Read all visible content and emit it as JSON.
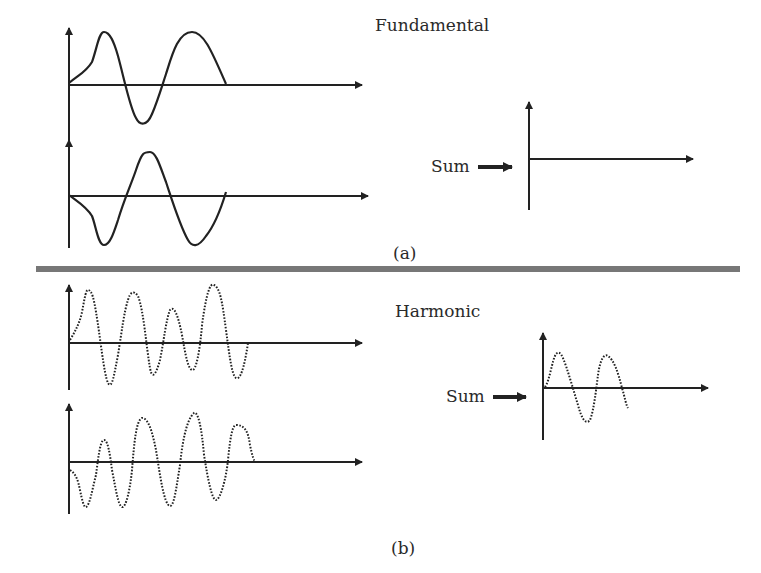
{
  "panel_a": {
    "title": "Fundamental",
    "sum_label": "Sum",
    "caption": "(a)",
    "waveform_style": "solid",
    "inputs": [
      "fundamental wave 1",
      "fundamental wave 2 (phase-inverted)"
    ],
    "sum_result": "flat line (waves cancel)"
  },
  "panel_b": {
    "title": "Harmonic",
    "sum_label": "Sum",
    "caption": "(b)",
    "waveform_style": "dotted",
    "inputs": [
      "harmonic wave 1",
      "harmonic wave 2"
    ],
    "sum_result": "residual harmonic waveform"
  },
  "colors": {
    "stroke": "#222222",
    "divider": "#777777",
    "background": "#ffffff"
  }
}
